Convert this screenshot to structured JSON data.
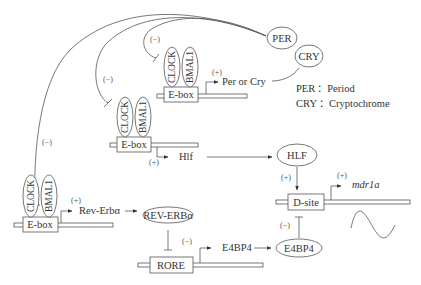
{
  "diagram": {
    "title": "",
    "proteins": {
      "clock": "CLOCK",
      "bmal1": "BMAL1",
      "per": "PER",
      "cry": "CRY",
      "hlf": "HLF",
      "rev_erba": "REV-ERBα",
      "e4bp4": "E4BP4"
    },
    "elements": {
      "ebox": "E-box",
      "rore": "RORE",
      "dsite": "D-site"
    },
    "genes": {
      "per_or_cry": "Per or Cry",
      "hlf": "Hlf",
      "rev_erba": "Rev-Erbα",
      "e4bp4": "E4BP4",
      "mdr1a": "mdr1a"
    },
    "signs": {
      "activation": "(+)",
      "inhibition": "(−)"
    },
    "legend": [
      {
        "abbr": "PER",
        "sep": "：",
        "full": "Period"
      },
      {
        "abbr": "CRY",
        "sep": "：",
        "full": "Cryptochrome"
      }
    ],
    "edges": [
      {
        "from": "CLOCK/BMAL1 @ E-box (top)",
        "to": "Per or Cry",
        "type": "activation"
      },
      {
        "from": "PER/CRY",
        "to": "CLOCK/BMAL1 (top)",
        "type": "inhibition"
      },
      {
        "from": "PER/CRY",
        "to": "CLOCK/BMAL1 (middle)",
        "type": "inhibition"
      },
      {
        "from": "PER/CRY",
        "to": "CLOCK/BMAL1 (bottom)",
        "type": "inhibition"
      },
      {
        "from": "CLOCK/BMAL1 @ E-box (middle)",
        "to": "Hlf",
        "type": "activation"
      },
      {
        "from": "Hlf",
        "to": "HLF",
        "type": "translation"
      },
      {
        "from": "CLOCK/BMAL1 @ E-box (bottom)",
        "to": "Rev-Erbα",
        "type": "activation"
      },
      {
        "from": "Rev-Erbα",
        "to": "REV-ERBα",
        "type": "translation"
      },
      {
        "from": "REV-ERBα",
        "to": "RORE",
        "type": "inhibition"
      },
      {
        "from": "RORE",
        "to": "E4BP4 (gene)",
        "type": "transcription"
      },
      {
        "from": "E4BP4 (gene)",
        "to": "E4BP4",
        "type": "translation"
      },
      {
        "from": "HLF",
        "to": "D-site",
        "type": "activation"
      },
      {
        "from": "E4BP4",
        "to": "D-site",
        "type": "inhibition"
      },
      {
        "from": "D-site",
        "to": "mdr1a",
        "type": "activation"
      }
    ]
  }
}
